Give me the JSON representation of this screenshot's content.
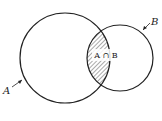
{
  "diagram": {
    "type": "venn",
    "sets": [
      {
        "id": "A",
        "label": "A"
      },
      {
        "id": "B",
        "label": "B"
      }
    ],
    "intersection": {
      "label": "A ∩ B",
      "shaded": true,
      "pattern": "diagonal-hatch"
    },
    "colors": {
      "stroke": "#222222",
      "hatch": "#555555",
      "background": "#ffffff"
    }
  }
}
